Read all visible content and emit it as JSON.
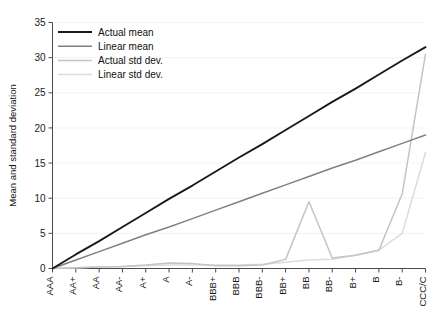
{
  "chart_data": {
    "type": "line",
    "title": "",
    "xlabel": "",
    "ylabel": "Mean and standard deviation",
    "xlim": [
      0,
      16
    ],
    "ylim": [
      0,
      35
    ],
    "yticks": [
      0,
      5,
      10,
      15,
      20,
      25,
      30,
      35
    ],
    "grid": true,
    "legend_position": "top-left",
    "categories": [
      "AAA",
      "AA+",
      "AA",
      "AA-",
      "A+",
      "A",
      "A-",
      "BBB+",
      "BBB",
      "BBB-",
      "BB+",
      "BB",
      "BB-",
      "B+",
      "B",
      "B-",
      "CCC/C"
    ],
    "series": [
      {
        "name": "Actual mean",
        "color": "#1a1a1a",
        "width": 1.9,
        "values": [
          0.0,
          2.0,
          3.9,
          5.9,
          7.9,
          9.9,
          11.8,
          13.8,
          15.8,
          17.7,
          19.7,
          21.7,
          23.7,
          25.6,
          27.6,
          29.6,
          31.5
        ]
      },
      {
        "name": "Linear mean",
        "color": "#808080",
        "width": 1.5,
        "values": [
          0.0,
          1.2,
          2.4,
          3.6,
          4.8,
          5.9,
          7.1,
          8.3,
          9.5,
          10.7,
          11.9,
          13.1,
          14.3,
          15.4,
          16.6,
          17.8,
          19.0
        ]
      },
      {
        "name": "Actual std dev.",
        "color": "#c4c4c4",
        "width": 1.5,
        "values": [
          0.0,
          0.1,
          0.2,
          0.3,
          0.5,
          0.8,
          0.7,
          0.4,
          0.4,
          0.5,
          1.3,
          9.5,
          1.5,
          1.9,
          2.6,
          10.6,
          30.5
        ]
      },
      {
        "name": "Linear std dev.",
        "color": "#dcdcdc",
        "width": 1.5,
        "values": [
          0.0,
          0.1,
          0.2,
          0.3,
          0.4,
          0.5,
          0.5,
          0.5,
          0.5,
          0.6,
          0.9,
          1.2,
          1.3,
          1.9,
          2.6,
          5.0,
          16.5
        ]
      }
    ]
  },
  "legend": {
    "items": [
      {
        "label": "Actual mean"
      },
      {
        "label": "Linear mean"
      },
      {
        "label": "Actual std dev."
      },
      {
        "label": "Linear std dev."
      }
    ]
  },
  "axes": {
    "y_axis_title": "Mean and standard deviation"
  }
}
